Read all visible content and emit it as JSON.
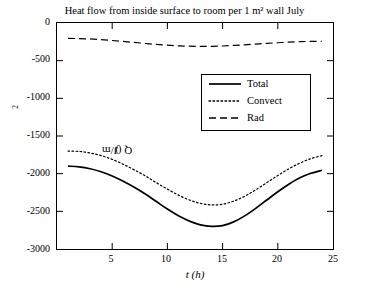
{
  "chart_data": {
    "type": "line",
    "title": "Heat flow from inside surface to room per 1 m²  wall July",
    "xlabel": "t (h)",
    "ylabel": "Q (J/m²)",
    "xlim": [
      0,
      25
    ],
    "ylim": [
      -3000,
      0
    ],
    "xticks": [
      5,
      10,
      15,
      20,
      25
    ],
    "yticks": [
      0,
      -500,
      -1000,
      -1500,
      -2000,
      -2500,
      -3000
    ],
    "ytick_labels": [
      "0",
      "-500",
      "-1000",
      "-1500",
      "-2000",
      "-2500",
      "-3000"
    ],
    "xtick_labels": [
      "5",
      "10",
      "15",
      "20",
      "25"
    ],
    "grid": false,
    "legend_position": "center-right-upper",
    "x": [
      1,
      2,
      3,
      4,
      5,
      6,
      7,
      8,
      9,
      10,
      11,
      12,
      13,
      14,
      15,
      16,
      17,
      18,
      19,
      20,
      21,
      22,
      23,
      24
    ],
    "series": [
      {
        "name": "Total",
        "style": "solid",
        "values": [
          -1900,
          -1910,
          -1935,
          -1975,
          -2030,
          -2100,
          -2180,
          -2270,
          -2370,
          -2470,
          -2560,
          -2630,
          -2680,
          -2700,
          -2690,
          -2640,
          -2560,
          -2460,
          -2350,
          -2240,
          -2140,
          -2055,
          -1995,
          -1955
        ]
      },
      {
        "name": "Convect",
        "style": "dotted",
        "values": [
          -1700,
          -1705,
          -1725,
          -1760,
          -1810,
          -1875,
          -1950,
          -2030,
          -2120,
          -2205,
          -2285,
          -2350,
          -2395,
          -2415,
          -2405,
          -2365,
          -2300,
          -2215,
          -2120,
          -2025,
          -1935,
          -1860,
          -1800,
          -1760
        ]
      },
      {
        "name": "Rad",
        "style": "dashed",
        "values": [
          -205,
          -207,
          -212,
          -220,
          -232,
          -245,
          -258,
          -272,
          -285,
          -295,
          -303,
          -308,
          -310,
          -309,
          -305,
          -298,
          -290,
          -280,
          -270,
          -262,
          -254,
          -248,
          -244,
          -242
        ]
      }
    ]
  },
  "legend": {
    "items": [
      {
        "label": "Total"
      },
      {
        "label": "Convect"
      },
      {
        "label": "Rad"
      }
    ]
  },
  "axis_labels": {
    "x": "t (h)",
    "y_prefix": "Q (J/m",
    "y_exp": "2",
    "y_suffix": ")"
  }
}
